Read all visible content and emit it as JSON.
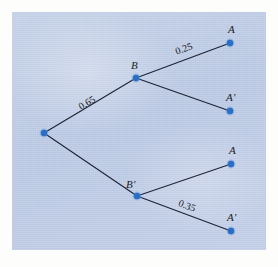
{
  "figure": {
    "kind": "probability-tree-diagram",
    "panel_background": "#c3d0e8",
    "node_color": "#2b6fc4",
    "edge_color": "#1d2333",
    "canvas": {
      "width": 278,
      "height": 267
    }
  },
  "nodes": [
    {
      "id": "root",
      "label": "",
      "x": 44,
      "y": 133
    },
    {
      "id": "B",
      "label": "B",
      "x": 136,
      "y": 78
    },
    {
      "id": "Bp",
      "label": "B'",
      "x": 137,
      "y": 196
    },
    {
      "id": "A1",
      "label": "A",
      "x": 230,
      "y": 43
    },
    {
      "id": "Ap1",
      "label": "A'",
      "x": 230,
      "y": 111
    },
    {
      "id": "A2",
      "label": "A",
      "x": 231,
      "y": 164
    },
    {
      "id": "Ap2",
      "label": "A'",
      "x": 231,
      "y": 231
    }
  ],
  "node_labels": [
    {
      "text": "B",
      "x": 131,
      "y": 60,
      "name": "node-label-B"
    },
    {
      "text": "B'",
      "x": 126,
      "y": 179,
      "name": "node-label-B-prime"
    },
    {
      "text": "A",
      "x": 228,
      "y": 24,
      "name": "node-label-A-top"
    },
    {
      "text": "A'",
      "x": 226,
      "y": 92,
      "name": "node-label-A-prime-top"
    },
    {
      "text": "A",
      "x": 229,
      "y": 145,
      "name": "node-label-A-bottom"
    },
    {
      "text": "A'",
      "x": 227,
      "y": 212,
      "name": "node-label-A-prime-bottom"
    }
  ],
  "edges": [
    {
      "from": "root",
      "to": "B",
      "label": "0.65",
      "name": "edge-root-to-B"
    },
    {
      "from": "root",
      "to": "Bp",
      "label": "",
      "name": "edge-root-to-B-prime"
    },
    {
      "from": "B",
      "to": "A1",
      "label": "0.25",
      "name": "edge-B-to-A"
    },
    {
      "from": "B",
      "to": "Ap1",
      "label": "",
      "name": "edge-B-to-A-prime"
    },
    {
      "from": "Bp",
      "to": "A2",
      "label": "",
      "name": "edge-B-prime-to-A"
    },
    {
      "from": "Bp",
      "to": "Ap2",
      "label": "0.35",
      "name": "edge-B-prime-to-A-prime"
    }
  ],
  "edge_labels": [
    {
      "text": "0.65",
      "x": 87,
      "y": 103,
      "rotate": -31,
      "name": "edge-label-0-65"
    },
    {
      "text": "0.25",
      "x": 184,
      "y": 49,
      "rotate": -20,
      "name": "edge-label-0-25"
    },
    {
      "text": "0.35",
      "x": 187,
      "y": 206,
      "rotate": 20,
      "name": "edge-label-0-35"
    }
  ],
  "chart_data": {
    "type": "diagram",
    "title": "",
    "branches": [
      {
        "stage": 1,
        "outcome": "B",
        "probability": 0.65
      },
      {
        "stage": 1,
        "outcome": "B'",
        "probability": null
      },
      {
        "stage": 2,
        "parent": "B",
        "outcome": "A",
        "probability": 0.25
      },
      {
        "stage": 2,
        "parent": "B",
        "outcome": "A'",
        "probability": null
      },
      {
        "stage": 2,
        "parent": "B'",
        "outcome": "A",
        "probability": null
      },
      {
        "stage": 2,
        "parent": "B'",
        "outcome": "A'",
        "probability": 0.35
      }
    ],
    "labels_shown": [
      "0.65",
      "0.25",
      "0.35"
    ]
  }
}
